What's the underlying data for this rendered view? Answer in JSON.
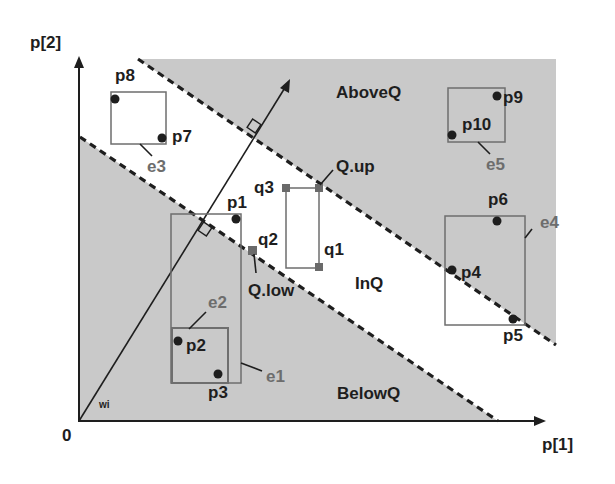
{
  "diagram": {
    "axes": {
      "x_label": "p[1]",
      "y_label": "p[2]",
      "origin_label": "0"
    },
    "vector_label": "wi",
    "regions": {
      "above": "AboveQ",
      "in": "InQ",
      "below": "BelowQ"
    },
    "query": {
      "up_label": "Q.up",
      "low_label": "Q.low",
      "corners": [
        "q1",
        "q2",
        "q3"
      ]
    },
    "points": [
      "p1",
      "p2",
      "p3",
      "p4",
      "p5",
      "p6",
      "p7",
      "p8",
      "p9",
      "p10"
    ],
    "entries": [
      "e1",
      "e2",
      "e3",
      "e4",
      "e5"
    ],
    "colors": {
      "shade": "#c8c8c8",
      "axis": "#1e1e1e",
      "box": "#6e6e6e",
      "query_marker": "#6a6a6a",
      "entry_label": "#6d6d6d"
    }
  }
}
